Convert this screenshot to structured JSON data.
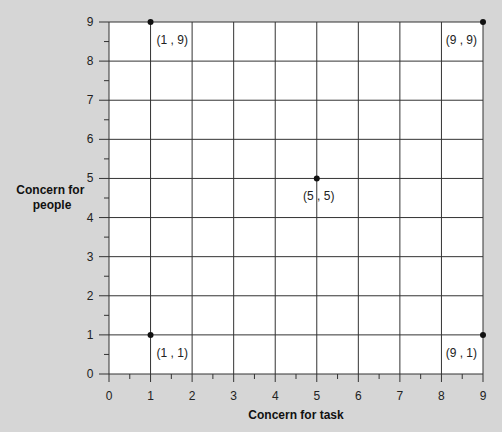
{
  "chart_data": {
    "type": "scatter",
    "title": "",
    "xlabel": "Concern for task",
    "ylabel": "Concern for people",
    "ylabel_lines": [
      "Concern for",
      "people"
    ],
    "xlim": [
      0,
      9
    ],
    "ylim": [
      0,
      9
    ],
    "grid": true,
    "x_ticks": [
      0,
      1,
      2,
      3,
      4,
      5,
      6,
      7,
      8,
      9
    ],
    "y_ticks": [
      0,
      1,
      2,
      3,
      4,
      5,
      6,
      7,
      8,
      9
    ],
    "points": [
      {
        "x": 1,
        "y": 9,
        "label": "(1 , 9)"
      },
      {
        "x": 9,
        "y": 9,
        "label": "(9 , 9)"
      },
      {
        "x": 5,
        "y": 5,
        "label": "(5 , 5)"
      },
      {
        "x": 1,
        "y": 1,
        "label": "(1 , 1)"
      },
      {
        "x": 9,
        "y": 1,
        "label": "(9 , 1)"
      }
    ]
  },
  "colors": {
    "background": "#d6d6d6",
    "plot": "#ffffff",
    "grid": "#333333",
    "point": "#111111"
  }
}
